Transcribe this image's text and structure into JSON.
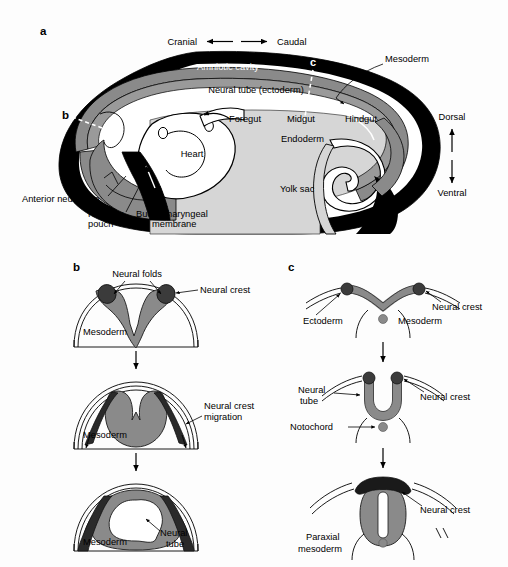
{
  "figure": {
    "background": "#fdfdfd",
    "palette": {
      "black": "#000000",
      "dark_gray": "#3b3b3b",
      "mid_gray": "#808080",
      "neural_gray": "#8a8a8a",
      "light_gray": "#d6d6d6",
      "white": "#ffffff"
    }
  },
  "panel_a": {
    "letter": "a",
    "axis": {
      "left_label": "Cranial",
      "right_label": "Caudal"
    },
    "orientation": {
      "top_label": "Dorsal",
      "bottom_label": "Ventral"
    },
    "section_markers": {
      "b": "b",
      "c": "c"
    },
    "labels": [
      "Amniotic cavity",
      "Neural tube (ectoderm)",
      "Mesoderm",
      "Foregut",
      "Midgut",
      "Hindgut",
      "Endoderm",
      "Heart",
      "Yolk sac",
      "Anterior neuropore",
      "Rathke's pouch",
      "Buccopharyngeal membrane"
    ],
    "label_amniotic_cavity": "Amniotic cavity",
    "label_neural_tube": "Neural tube (ectoderm)",
    "label_mesoderm": "Mesoderm",
    "label_foregut": "Foregut",
    "label_midgut": "Midgut",
    "label_hindgut": "Hindgut",
    "label_endoderm": "Endoderm",
    "label_heart": "Heart",
    "label_yolk_sac": "Yolk sac",
    "label_anterior_neuropore": "Anterior neuropore",
    "label_rathkes_1": "Rathke's",
    "label_rathkes_2": "pouch",
    "label_buccopharyngeal_1": "Buccopharyngeal",
    "label_buccopharyngeal_2": "membrane"
  },
  "panel_b": {
    "letter": "b",
    "stage1": {
      "label_neural_folds": "Neural folds",
      "label_neural_crest": "Neural crest",
      "label_mesoderm": "Mesoderm"
    },
    "stage2": {
      "label_neural_crest_1": "Neural crest",
      "label_neural_crest_2": "migration",
      "label_mesoderm": "Mesoderm"
    },
    "stage3": {
      "label_neural_tube_1": "Neural",
      "label_neural_tube_2": "tube",
      "label_mesoderm": "Mesoderm"
    }
  },
  "panel_c": {
    "letter": "c",
    "stage1": {
      "label_ectoderm": "Ectoderm",
      "label_neural_crest": "Neural crest",
      "label_mesoderm": "Mesoderm"
    },
    "stage2": {
      "label_neural_tube_1": "Neural",
      "label_neural_tube_2": "tube",
      "label_notochord": "Notochord",
      "label_neural_crest": "Neural crest"
    },
    "stage3": {
      "label_neural_crest": "Neural crest",
      "label_paraxial_1": "Paraxial",
      "label_paraxial_2": "mesoderm"
    }
  }
}
